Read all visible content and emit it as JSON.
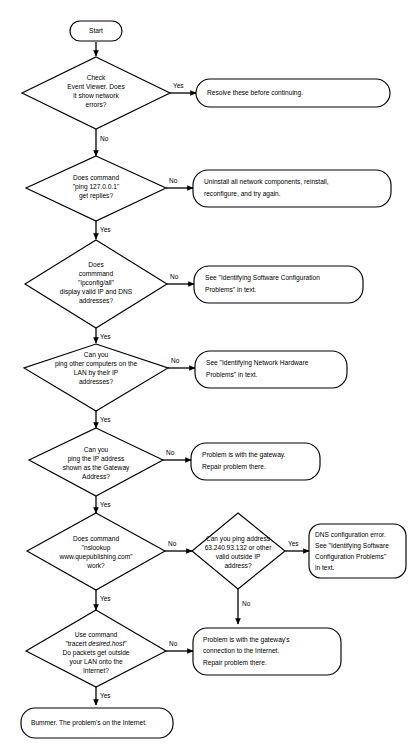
{
  "diagram": {
    "kind": "flowchart",
    "colors": {
      "stroke": "#000000",
      "fill": "#ffffff",
      "text": "#000000"
    },
    "nodes": {
      "start": {
        "shape": "terminator",
        "label": "Start"
      },
      "d1": {
        "shape": "decision",
        "lines": [
          "Check",
          "Event Viewer. Does",
          "it show network",
          "errors?"
        ]
      },
      "b1": {
        "shape": "terminator",
        "lines": [
          "Resolve these before continuing."
        ]
      },
      "d2": {
        "shape": "decision",
        "lines": [
          "Does command",
          "\"ping 127.0.0.1\"",
          "get replies?"
        ]
      },
      "b2": {
        "shape": "terminator",
        "lines": [
          "Uninstall all network components, reinstall,",
          "reconfigure, and try again."
        ]
      },
      "d3": {
        "shape": "decision",
        "lines": [
          "Does",
          "commmand",
          "\"ipconfig/all\"",
          "display valid IP and DNS",
          "addresses?"
        ]
      },
      "b3": {
        "shape": "terminator",
        "lines": [
          "See \"Identifying Software Configuration",
          "Problems\" in text."
        ]
      },
      "d4": {
        "shape": "decision",
        "lines": [
          "Can you",
          "ping other computers on the",
          "LAN by their IP",
          "addresses?"
        ]
      },
      "b4": {
        "shape": "terminator",
        "lines": [
          "See \"Identifying Network Hardware",
          "Problems\" in text."
        ]
      },
      "d5": {
        "shape": "decision",
        "lines": [
          "Can you",
          "ping the IP address",
          "shown as the Gateway",
          "Address?"
        ]
      },
      "b5": {
        "shape": "terminator",
        "lines": [
          "Problem is with the gateway.",
          "Repair problem there."
        ]
      },
      "d6": {
        "shape": "decision",
        "lines": [
          "Does command",
          "\"nslookup",
          "www.quepublishing.com\"",
          "work?"
        ]
      },
      "d7": {
        "shape": "decision",
        "lines": [
          "Can you ping address",
          "63.240.93.132 or other",
          "valid outside IP",
          "address?"
        ]
      },
      "b7": {
        "shape": "terminator",
        "lines": [
          "DNS configuration error.",
          "See \"Identifying Software",
          "Configuration Problems\"",
          "in text."
        ]
      },
      "d8": {
        "shape": "decision",
        "lines": [
          "Use command",
          "\"tracert desired.host\"",
          "Do packets get outside",
          "your LAN onto the",
          "Internet?"
        ],
        "italic_segment": "desired.host"
      },
      "b8": {
        "shape": "terminator",
        "lines": [
          "Problem is with the gateway's",
          "connection to the Internet.",
          "Repair problem there."
        ]
      },
      "b9": {
        "shape": "terminator",
        "lines": [
          "Bummer. The problem's on the Internet."
        ]
      }
    },
    "edge_labels": {
      "d1_yes": "Yes",
      "d1_no": "No",
      "d2_no": "No",
      "d2_yes": "Yes",
      "d3_no": "No",
      "d3_yes": "Yes",
      "d4_no": "No",
      "d4_yes": "Yes",
      "d5_no": "No",
      "d5_yes": "Yes",
      "d6_no": "No",
      "d6_yes": "Yes",
      "d7_yes": "Yes",
      "d7_no": "No",
      "d8_no": "No",
      "d8_yes": "Yes"
    }
  }
}
